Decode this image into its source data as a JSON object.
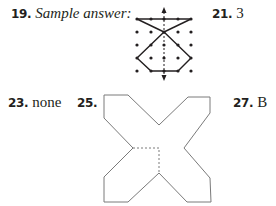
{
  "answers": [
    {
      "number": "19.",
      "text": "Sample answer:",
      "italic": true
    },
    {
      "number": "21.",
      "text": "3"
    },
    {
      "number": "23.",
      "text": "none"
    },
    {
      "number": "25.",
      "text": ""
    },
    {
      "number": "27.",
      "text": "B"
    }
  ],
  "figure_19": {
    "description": "5x5 dot grid with vertical dashed line of symmetry (double-headed arrow) and a symmetric figure: horizontal top segment, crossing diagonals to center, hexagon below",
    "grid_columns": 5,
    "grid_rows": 5,
    "line_color": "#231f20"
  },
  "figure_25": {
    "description": "X-shaped net outline with dashed fold lines at center",
    "line_color": "#808080",
    "dash_color": "#808080"
  }
}
